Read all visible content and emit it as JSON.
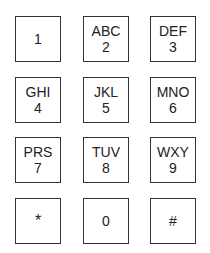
{
  "keypad": {
    "keys": [
      {
        "digit": "1",
        "letters": ""
      },
      {
        "digit": "2",
        "letters": "ABC"
      },
      {
        "digit": "3",
        "letters": "DEF"
      },
      {
        "digit": "4",
        "letters": "GHI"
      },
      {
        "digit": "5",
        "letters": "JKL"
      },
      {
        "digit": "6",
        "letters": "MNO"
      },
      {
        "digit": "7",
        "letters": "PRS"
      },
      {
        "digit": "8",
        "letters": "TUV"
      },
      {
        "digit": "9",
        "letters": "WXY"
      },
      {
        "digit": "*",
        "letters": ""
      },
      {
        "digit": "0",
        "letters": ""
      },
      {
        "digit": "#",
        "letters": ""
      }
    ],
    "colors": {
      "border": "#333333",
      "text": "#222222",
      "background": "#ffffff"
    }
  }
}
